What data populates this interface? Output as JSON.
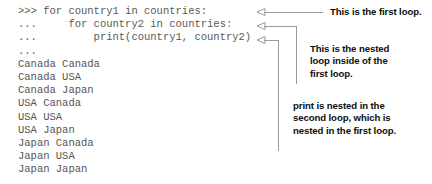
{
  "figure": {
    "kind": "annotated-python-repl-figure",
    "line_color": "#9a9a9a",
    "code_color": "#5a5a5a",
    "callout_color": "#0d0d0d",
    "background": "#ffffff"
  },
  "repl": {
    "prompt_primary": ">>> ",
    "prompt_continuation": "... ",
    "code_lines": [
      {
        "id": "line-for-country1",
        "text": ">>> for country1 in countries:"
      },
      {
        "id": "line-for-country2",
        "text": "...     for country2 in countries:"
      },
      {
        "id": "line-print",
        "text": "...         print(country1, country2)"
      },
      {
        "id": "line-blank-prompt",
        "text": "... "
      }
    ],
    "output_lines": [
      {
        "id": "out-1",
        "text": "Canada Canada"
      },
      {
        "id": "out-2",
        "text": "Canada USA"
      },
      {
        "id": "out-3",
        "text": "Canada Japan"
      },
      {
        "id": "out-4",
        "text": "USA Canada"
      },
      {
        "id": "out-5",
        "text": "USA USA"
      },
      {
        "id": "out-6",
        "text": "USA Japan"
      },
      {
        "id": "out-7",
        "text": "Japan Canada"
      },
      {
        "id": "out-8",
        "text": "Japan USA"
      },
      {
        "id": "out-9",
        "text": "Japan Japan"
      }
    ]
  },
  "callouts": [
    {
      "id": "callout-first-loop",
      "target": "line-for-country1",
      "lines": [
        "This is the first loop."
      ]
    },
    {
      "id": "callout-nested-loop",
      "target": "line-for-country2",
      "lines": [
        "This is the nested",
        "loop inside of the",
        "first loop."
      ]
    },
    {
      "id": "callout-print-nesting",
      "target": "line-print",
      "lines": [
        "print is nested in the",
        "second loop, which is",
        "nested in the first loop."
      ]
    }
  ],
  "leaders": [
    {
      "id": "leader-1",
      "arrow_x": 258,
      "y": 12,
      "elbow_x": 323,
      "drop_to": 12
    },
    {
      "id": "leader-2",
      "arrow_x": 258,
      "y": 26,
      "elbow_x": 296,
      "drop_to": 84
    },
    {
      "id": "leader-3",
      "arrow_x": 258,
      "y": 40,
      "elbow_x": 278,
      "drop_to": 151
    }
  ]
}
